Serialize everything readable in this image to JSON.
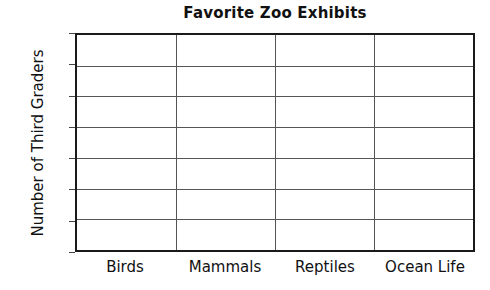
{
  "chart_data": {
    "type": "bar",
    "title": "Favorite Zoo Exhibits",
    "subtitle": "",
    "xlabel": "",
    "ylabel": "Number of Third Graders",
    "categories": [
      "Birds",
      "Mammals",
      "Reptiles",
      "Ocean Life"
    ],
    "values": [
      0,
      0,
      0,
      0
    ],
    "series": [
      {
        "name": "Number of Third Graders",
        "values": [
          0,
          0,
          0,
          0
        ]
      }
    ],
    "ylim": [
      0,
      14
    ],
    "ytick_labels": [
      "0",
      "2",
      "4",
      "6",
      "8",
      "10",
      "12",
      "14"
    ],
    "ytick_values": [
      0,
      2,
      4,
      6,
      8,
      10,
      12,
      14
    ],
    "ytick_step": 2,
    "grid": "horizontal-and-category-dividers",
    "legend": "none",
    "annotations": [],
    "note": "Blank worksheet bar-graph template: axes and grid drawn, no bars plotted",
    "colors": {
      "background": "#ffffff",
      "axis": "#1a1a1a",
      "gridline": "#555555",
      "text": "#111111"
    }
  }
}
